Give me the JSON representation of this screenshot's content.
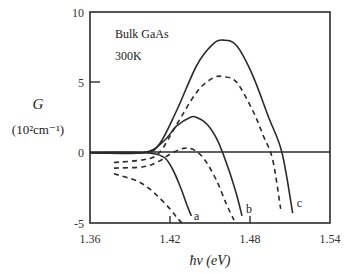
{
  "chart_data": {
    "type": "line",
    "title": "",
    "annotations": [
      "Bulk GaAs",
      "300K"
    ],
    "xlabel": "ħν (eV)",
    "ylabel": "G",
    "ylabel_unit": "(10²cm⁻¹)",
    "xlim": [
      1.36,
      1.54
    ],
    "ylim": [
      -5,
      10
    ],
    "xticks": [
      "1.36",
      "1.42",
      "1.48",
      "1.54"
    ],
    "yticks": [
      "10",
      "5",
      "0",
      "-5"
    ],
    "grid": false,
    "legend": "curve labels a, b, c at lower-right ends",
    "series": [
      {
        "name": "a (solid)",
        "style": "solid",
        "x": [
          1.36,
          1.4,
          1.415,
          1.422,
          1.428,
          1.433,
          1.436
        ],
        "y": [
          0.0,
          0.0,
          -0.3,
          -1.2,
          -2.5,
          -3.8,
          -4.5
        ]
      },
      {
        "name": "a (dashed)",
        "style": "dashed",
        "x": [
          1.378,
          1.395,
          1.405,
          1.413,
          1.42,
          1.425,
          1.429
        ],
        "y": [
          -1.5,
          -2.0,
          -2.6,
          -3.3,
          -4.0,
          -4.6,
          -5.0
        ]
      },
      {
        "name": "b (solid)",
        "style": "solid",
        "x": [
          1.36,
          1.4,
          1.415,
          1.425,
          1.435,
          1.44,
          1.448,
          1.456,
          1.464,
          1.47,
          1.474
        ],
        "y": [
          0.0,
          0.0,
          0.8,
          1.9,
          2.5,
          2.5,
          2.0,
          0.8,
          -1.2,
          -3.0,
          -4.5
        ]
      },
      {
        "name": "b (dashed)",
        "style": "dashed",
        "x": [
          1.378,
          1.4,
          1.412,
          1.42,
          1.43,
          1.438,
          1.446,
          1.455,
          1.462,
          1.468
        ],
        "y": [
          -1.1,
          -1.0,
          -0.6,
          -0.1,
          0.3,
          0.2,
          -0.5,
          -2.0,
          -3.6,
          -4.8
        ]
      },
      {
        "name": "c (solid)",
        "style": "solid",
        "x": [
          1.36,
          1.4,
          1.412,
          1.425,
          1.44,
          1.452,
          1.46,
          1.47,
          1.482,
          1.494,
          1.504,
          1.512
        ],
        "y": [
          0.0,
          0.0,
          0.6,
          3.0,
          6.2,
          7.7,
          8.0,
          7.6,
          5.5,
          2.5,
          0.0,
          -4.3
        ]
      },
      {
        "name": "c (dashed)",
        "style": "dashed",
        "x": [
          1.378,
          1.4,
          1.412,
          1.425,
          1.44,
          1.452,
          1.46,
          1.47,
          1.482,
          1.49,
          1.497,
          1.503
        ],
        "y": [
          -0.7,
          -0.5,
          0.0,
          2.0,
          4.3,
          5.3,
          5.4,
          5.0,
          3.0,
          1.2,
          -0.5,
          -4.0
        ]
      }
    ],
    "curve_labels": [
      {
        "text": "a",
        "x": 1.438,
        "y": -4.5
      },
      {
        "text": "b",
        "x": 1.477,
        "y": -4.0
      },
      {
        "text": "c",
        "x": 1.515,
        "y": -3.6
      }
    ]
  }
}
